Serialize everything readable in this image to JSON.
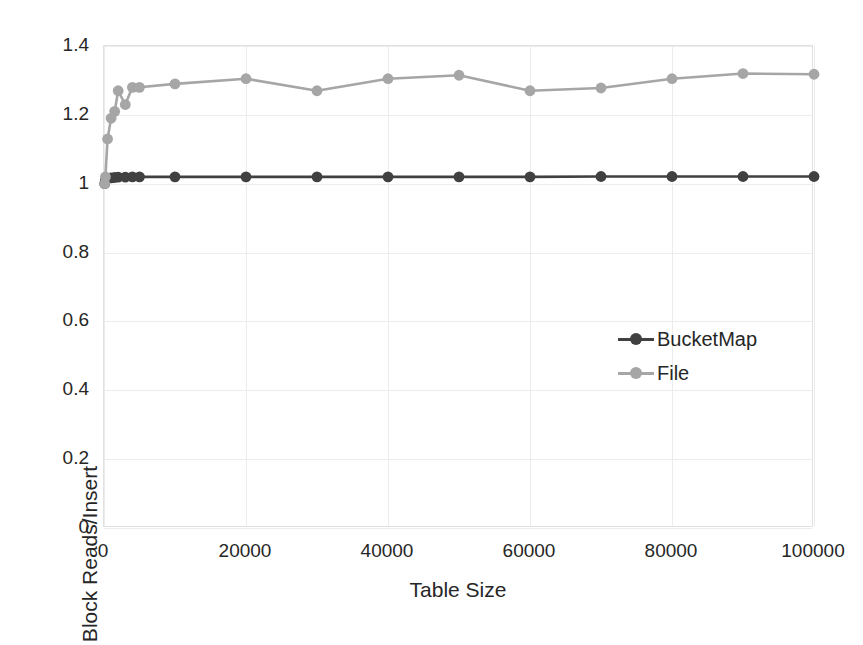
{
  "chart_data": {
    "type": "line",
    "title": "",
    "xlabel": "Table Size",
    "ylabel": "Block Reads/Insert",
    "xlim": [
      0,
      100000
    ],
    "ylim": [
      0,
      1.4
    ],
    "x_ticks": [
      "0",
      "20000",
      "40000",
      "60000",
      "80000",
      "100000"
    ],
    "x_tick_values": [
      0,
      20000,
      40000,
      60000,
      80000,
      100000
    ],
    "y_ticks": [
      "0",
      "0.2",
      "0.4",
      "0.6",
      "0.8",
      "1",
      "1.2",
      "1.4"
    ],
    "y_tick_values": [
      0,
      0.2,
      0.4,
      0.6,
      0.8,
      1,
      1.2,
      1.4
    ],
    "grid": true,
    "legend_position": "center-right-inside",
    "series": [
      {
        "name": "BucketMap",
        "color": "#404040",
        "marker": "circle",
        "x": [
          100,
          200,
          500,
          1000,
          1500,
          2000,
          3000,
          4000,
          5000,
          10000,
          20000,
          30000,
          40000,
          50000,
          60000,
          70000,
          80000,
          90000,
          100000
        ],
        "values": [
          1.0,
          1.01,
          1.015,
          1.017,
          1.018,
          1.019,
          1.019,
          1.02,
          1.02,
          1.02,
          1.02,
          1.02,
          1.02,
          1.02,
          1.02,
          1.021,
          1.021,
          1.021,
          1.021
        ]
      },
      {
        "name": "File",
        "color": "#a6a6a6",
        "marker": "circle",
        "x": [
          100,
          200,
          500,
          1000,
          1500,
          2000,
          3000,
          4000,
          5000,
          10000,
          20000,
          30000,
          40000,
          50000,
          60000,
          70000,
          80000,
          90000,
          100000
        ],
        "values": [
          1.0,
          1.02,
          1.13,
          1.19,
          1.21,
          1.27,
          1.23,
          1.28,
          1.28,
          1.29,
          1.305,
          1.27,
          1.305,
          1.315,
          1.27,
          1.278,
          1.305,
          1.32,
          1.318
        ]
      }
    ]
  },
  "legend": {
    "items": [
      {
        "label": "BucketMap",
        "color": "#404040"
      },
      {
        "label": "File",
        "color": "#a6a6a6"
      }
    ]
  },
  "colors": {
    "bucketmap": "#404040",
    "file": "#a6a6a6",
    "grid": "#ececec",
    "axis_text": "#262626",
    "background": "#ffffff"
  }
}
